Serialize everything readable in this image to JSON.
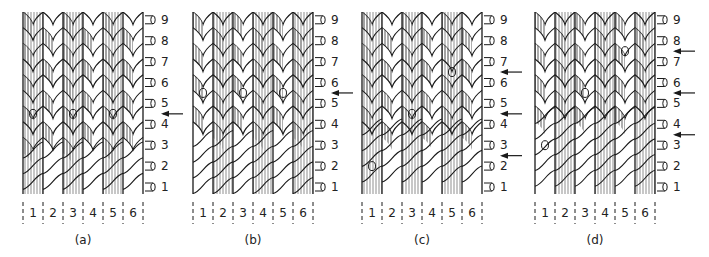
{
  "figure": {
    "panels": [
      {
        "id": "a",
        "caption": "(a)",
        "x": 23,
        "width": 120,
        "rows": [
          "9",
          "8",
          "7",
          "6",
          "5",
          "4",
          "3",
          "2",
          "1"
        ],
        "columns": [
          "1",
          "2",
          "3",
          "4",
          "5",
          "6"
        ],
        "arrows_after_row": [
          5
        ],
        "markers_o": [
          {
            "col": 1,
            "row": 4.5
          },
          {
            "col": 3,
            "row": 4.5
          },
          {
            "col": 5,
            "row": 4.5
          }
        ],
        "diagonal_rows": 4
      },
      {
        "id": "b",
        "caption": "(b)",
        "x": 193,
        "width": 120,
        "rows": [
          "9",
          "8",
          "7",
          "6",
          "5",
          "4",
          "3",
          "2",
          "1"
        ],
        "columns": [
          "1",
          "2",
          "3",
          "4",
          "5",
          "6"
        ],
        "arrows_after_row": [
          6
        ],
        "markers_o": [
          {
            "col": 1,
            "row": 5.5
          },
          {
            "col": 3,
            "row": 5.5
          },
          {
            "col": 5,
            "row": 5.5
          }
        ],
        "diagonal_rows": 5
      },
      {
        "id": "c",
        "caption": "(c)",
        "x": 362,
        "width": 120,
        "rows": [
          "9",
          "8",
          "7",
          "6",
          "5",
          "4",
          "3",
          "2",
          "1"
        ],
        "columns": [
          "1",
          "2",
          "3",
          "4",
          "5",
          "6"
        ],
        "arrows_after_row": [
          7,
          5,
          3
        ],
        "markers_o": [
          {
            "col": 1,
            "row": 2
          },
          {
            "col": 3,
            "row": 4.5
          },
          {
            "col": 5,
            "row": 6.5
          }
        ],
        "diagonal_rows": 6
      },
      {
        "id": "d",
        "caption": "(d)",
        "x": 535,
        "width": 120,
        "rows": [
          "9",
          "8",
          "7",
          "6",
          "5",
          "4",
          "3",
          "2",
          "1"
        ],
        "columns": [
          "1",
          "2",
          "3",
          "4",
          "5",
          "6"
        ],
        "arrows_after_row": [
          8,
          6,
          4
        ],
        "markers_o": [
          {
            "col": 1,
            "row": 3
          },
          {
            "col": 3,
            "row": 5.5
          },
          {
            "col": 5,
            "row": 7.5
          }
        ],
        "diagonal_rows": 7
      }
    ],
    "marker_label": "o",
    "ink_color": "#1a1a1a",
    "background": "#ffffff"
  }
}
